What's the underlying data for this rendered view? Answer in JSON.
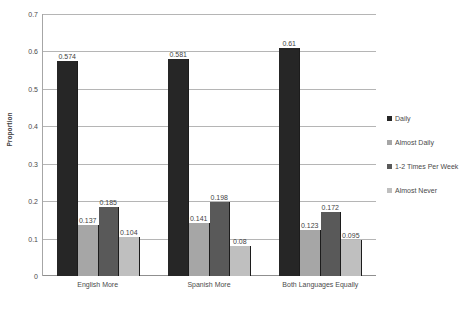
{
  "chart_data": {
    "type": "bar",
    "title": "",
    "xlabel": "",
    "ylabel": "Proportion",
    "ylim": [
      0,
      0.7
    ],
    "grid": true,
    "legend_position": "right",
    "categories": [
      "English More",
      "Spanish More",
      "Both Languages Equally"
    ],
    "y_ticks": [
      "0.7",
      "0.6",
      "0.5",
      "0.4",
      "0.3",
      "0.2",
      "0.1",
      "0"
    ],
    "y_tick_values": [
      0.7,
      0.6,
      0.5,
      0.4,
      0.3,
      0.2,
      0.1,
      0
    ],
    "series": [
      {
        "name": "Daily",
        "color": "#262626",
        "values": [
          0.574,
          0.581,
          0.61
        ],
        "labels": [
          "0.574",
          "0.581",
          "0.61"
        ]
      },
      {
        "name": "Almost Daily",
        "color": "#a6a6a6",
        "values": [
          0.137,
          0.141,
          0.123
        ],
        "labels": [
          "0.137",
          "0.141",
          "0.123"
        ]
      },
      {
        "name": "1-2 Times Per Week",
        "color": "#595959",
        "values": [
          0.185,
          0.198,
          0.172
        ],
        "labels": [
          "0.185",
          "0.198",
          "0.172"
        ]
      },
      {
        "name": "Almost Never",
        "color": "#bfbfbf",
        "values": [
          0.104,
          0.08,
          0.095
        ],
        "labels": [
          "0.104",
          "0.08",
          "0.095"
        ]
      }
    ]
  },
  "legend": {
    "items": [
      {
        "label": "Daily",
        "color": "#262626"
      },
      {
        "label": "Almost Daily",
        "color": "#a6a6a6"
      },
      {
        "label": "1-2 Times Per Week",
        "color": "#595959"
      },
      {
        "label": "Almost Never",
        "color": "#bfbfbf"
      }
    ]
  }
}
